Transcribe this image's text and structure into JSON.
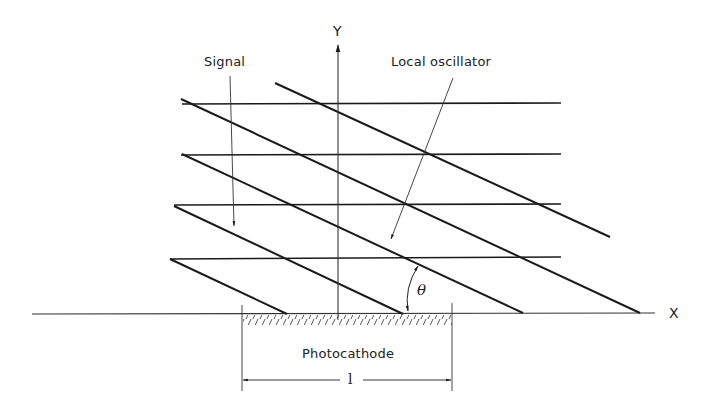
{
  "diagram": {
    "type": "optical heterodyne wavefront diagram",
    "labels": {
      "signal": "Signal",
      "local_oscillator": "Local oscillator",
      "y_axis": "Y",
      "x_axis": "X",
      "angle": "θ",
      "photocathode": "Photocathode",
      "length": "l"
    },
    "colors": {
      "background": "#ffffff",
      "line": "#1a1a1a",
      "thin_line": "#333333"
    },
    "signal_wavefronts": {
      "orientation": "horizontal",
      "count": 4
    },
    "local_oscillator_wavefronts": {
      "orientation": "tilted at angle θ to X axis",
      "count": 5
    }
  }
}
